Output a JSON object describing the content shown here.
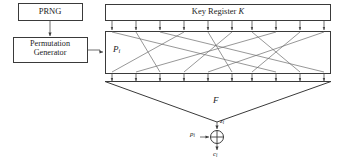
{
  "diagram": {
    "background_color": "#ffffff",
    "line_color": "#3a3a3a",
    "text_color": "#1c1c1c",
    "width": 339,
    "height": 167
  },
  "blocks": {
    "prng": {
      "label": "PRNG",
      "x": 18,
      "y": 3,
      "w": 64,
      "h": 17
    },
    "permutation_generator": {
      "label_line1": "Permutation",
      "label_line2": "Generator",
      "x": 13,
      "y": 37,
      "w": 74,
      "h": 25
    },
    "key_register": {
      "label_text": "Key Register ",
      "label_symbol": "K",
      "x": 105,
      "y": 4,
      "w": 226,
      "h": 16
    },
    "permutation_box": {
      "label_base": "P",
      "label_sub": "i",
      "x": 105,
      "y": 31,
      "w": 226,
      "h": 42
    }
  },
  "labels": {
    "function": "F",
    "keystream": {
      "base": "z",
      "sub": "i"
    },
    "plaintext": {
      "base": "p",
      "sub": "i"
    },
    "ciphertext": {
      "base": "c",
      "sub": "i"
    }
  },
  "wiring": {
    "num_taps": 10,
    "tap_x": [
      112,
      136,
      160,
      184,
      208,
      232,
      252,
      276,
      300,
      324
    ],
    "key_to_perm_arrow_y_start": 20,
    "key_to_perm_arrow_y_end": 31,
    "perm_out_arrow_y_start": 73,
    "perm_out_arrow_y_end": 82,
    "permutation_mapping": [
      7,
      2,
      9,
      0,
      5,
      3,
      8,
      1,
      6,
      4
    ]
  },
  "xor": {
    "symbol": "+",
    "cx": 217,
    "cy": 137,
    "r": 7
  },
  "funnel": {
    "left_x": 105,
    "right_x": 331,
    "top_y": 82,
    "apex_x": 217,
    "apex_y": 122
  }
}
